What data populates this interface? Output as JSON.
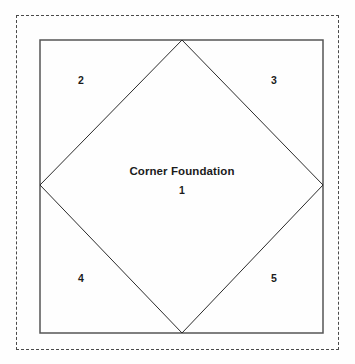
{
  "diagram": {
    "type": "quilt-block-foundation-piecing-diagram",
    "center": {
      "title": "Corner Foundation",
      "number": "1"
    },
    "pieces": [
      {
        "number": "2",
        "position": "top-left"
      },
      {
        "number": "3",
        "position": "top-right"
      },
      {
        "number": "4",
        "position": "bottom-left"
      },
      {
        "number": "5",
        "position": "bottom-right"
      }
    ],
    "colors": {
      "background": "#fefefe",
      "dashed_border": "#4a4a4a",
      "block_outline": "#555555",
      "diamond_line": "#2b2b2b",
      "label_text": "#1b1b1b"
    },
    "geometry": {
      "dashed_border": {
        "x": 16,
        "y": 15,
        "width": 323,
        "height": 335
      },
      "block_square": {
        "x": 40,
        "y": 40,
        "width": 283,
        "height": 293
      },
      "diamond_vertices": [
        {
          "x": 182,
          "y": 40
        },
        {
          "x": 323,
          "y": 185
        },
        {
          "x": 182,
          "y": 333
        },
        {
          "x": 40,
          "y": 185
        }
      ]
    }
  }
}
